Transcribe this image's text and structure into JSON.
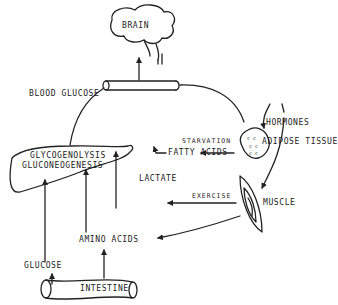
{
  "diagram": {
    "colors": {
      "ink": "#222222",
      "background": "#ffffff"
    },
    "nodes": {
      "brain": "BRAIN",
      "blood_glucose": "BLOOD GLUCOSE",
      "liver_line1": "GLYCOGENOLYSIS",
      "liver_line2": "GLUCONEOGENESIS",
      "fatty_acids": "FATTY ACIDS",
      "lactate": "LACTATE",
      "amino_acids": "AMINO ACIDS",
      "glucose": "GLUCOSE",
      "intestine": "INTESTINE",
      "hormones": "HORMONES",
      "starvation": "STARVATION",
      "adipose_tissue": "ADIPOSE TISSUE",
      "exercise": "EXERCISE",
      "muscle": "MUSCLE"
    },
    "edges": [
      {
        "from": "blood_glucose",
        "to": "brain"
      },
      {
        "from": "liver",
        "to": "blood_glucose"
      },
      {
        "from": "blood_glucose",
        "to": "adipose_tissue"
      },
      {
        "from": "hormones",
        "to": "adipose_tissue"
      },
      {
        "from": "hormones",
        "to": "muscle"
      },
      {
        "from": "adipose_tissue",
        "to": "fatty_acids",
        "label": "starvation"
      },
      {
        "from": "fatty_acids",
        "to": "liver"
      },
      {
        "from": "muscle",
        "to": "lactate",
        "label": "exercise"
      },
      {
        "from": "lactate",
        "to": "liver"
      },
      {
        "from": "muscle",
        "to": "amino_acids"
      },
      {
        "from": "amino_acids",
        "to": "liver"
      },
      {
        "from": "intestine",
        "to": "amino_acids"
      },
      {
        "from": "intestine",
        "to": "glucose"
      },
      {
        "from": "glucose",
        "to": "liver"
      }
    ]
  }
}
